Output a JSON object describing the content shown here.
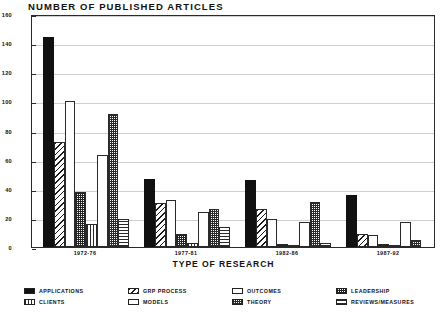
{
  "chart_data": {
    "type": "bar",
    "title": "NUMBER OF PUBLISHED ARTICLES",
    "xlabel": "TYPE OF RESEARCH",
    "ylabel": "",
    "ylim": [
      0,
      160
    ],
    "yticks": [
      0,
      20,
      40,
      60,
      80,
      100,
      120,
      140,
      160
    ],
    "grid": true,
    "legend_position": "bottom",
    "categories": [
      "1972-76",
      "1977-81",
      "1982-86",
      "1987-92"
    ],
    "series": [
      {
        "name": "APPLICATIONS",
        "pattern": "solid-black",
        "values": [
          144,
          47,
          46,
          36
        ]
      },
      {
        "name": "GRP PROCESS",
        "pattern": "diagonal-hatch",
        "values": [
          72,
          30,
          26,
          9
        ]
      },
      {
        "name": "OUTCOMES",
        "pattern": "white",
        "values": [
          100,
          32,
          19,
          8
        ]
      },
      {
        "name": "LEADERSHIP",
        "pattern": "dense-texture",
        "values": [
          38,
          9,
          2,
          2
        ]
      },
      {
        "name": "CLIENTS",
        "pattern": "vertical-lines",
        "values": [
          16,
          3,
          1,
          1
        ]
      },
      {
        "name": "MODELS",
        "pattern": "white",
        "values": [
          63,
          24,
          17,
          17
        ]
      },
      {
        "name": "THEORY",
        "pattern": "dark-check",
        "values": [
          91,
          26,
          31,
          5
        ]
      },
      {
        "name": "REVIEWS/MEASURES",
        "pattern": "horizontal-lines",
        "values": [
          19,
          14,
          3,
          0
        ]
      }
    ]
  },
  "axis": {
    "y_tick_labels": [
      "0",
      "20",
      "40",
      "60",
      "80",
      "100",
      "120",
      "140",
      "160"
    ]
  },
  "legend": {
    "items": [
      {
        "label": "APPLICATIONS",
        "swatch": "p-solid"
      },
      {
        "label": "GRP PROCESS",
        "swatch": "p-diag"
      },
      {
        "label": "OUTCOMES",
        "swatch": "p-white"
      },
      {
        "label": "LEADERSHIP",
        "swatch": "p-dense"
      },
      {
        "label": "CLIENTS",
        "swatch": "p-vert"
      },
      {
        "label": "MODELS",
        "swatch": "p-white"
      },
      {
        "label": "THEORY",
        "swatch": "p-check"
      },
      {
        "label": "REVIEWS/MEASURES",
        "swatch": "p-horz"
      }
    ]
  }
}
